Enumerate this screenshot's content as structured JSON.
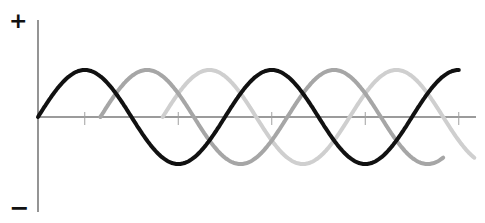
{
  "labels": {
    "positive": "+",
    "negative": "−"
  },
  "chart_data": {
    "type": "line",
    "title": "",
    "xlabel": "",
    "ylabel": "",
    "y_axis_labels": [
      "+",
      "−"
    ],
    "grid": false,
    "legend": null,
    "ylim": [
      -1.2,
      1.2
    ],
    "x_units": "degrees",
    "xlim": [
      0,
      825
    ],
    "x_ticks": [
      90,
      270,
      450,
      630,
      810
    ],
    "series": [
      {
        "name": "Phase 1",
        "color": "#111111",
        "phase_deg": 0,
        "start_deg": 0,
        "end_deg": 810,
        "amplitude": 1
      },
      {
        "name": "Phase 2",
        "color": "#a6a6a6",
        "phase_deg": 120,
        "start_deg": 120,
        "end_deg": 780,
        "amplitude": 1
      },
      {
        "name": "Phase 3",
        "color": "#cfcfcf",
        "phase_deg": 240,
        "start_deg": 240,
        "end_deg": 840,
        "amplitude": 1
      }
    ]
  }
}
